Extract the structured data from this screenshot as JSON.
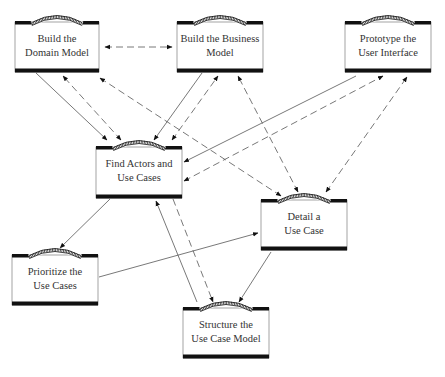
{
  "diagram": {
    "type": "activity-workflow",
    "colors": {
      "line": "#555555",
      "bar": "#111111",
      "box_fill": "#ffffff",
      "text": "#333333"
    },
    "activities": [
      {
        "id": "domain",
        "lines": [
          "Build the",
          "Domain Model"
        ],
        "x": 15,
        "y": 22,
        "w": 84,
        "h": 50
      },
      {
        "id": "business",
        "lines": [
          "Build the Business",
          "Model"
        ],
        "x": 177,
        "y": 22,
        "w": 86,
        "h": 50
      },
      {
        "id": "prototype",
        "lines": [
          "Prototype the",
          "User Interface"
        ],
        "x": 345,
        "y": 22,
        "w": 86,
        "h": 50
      },
      {
        "id": "find",
        "lines": [
          "Find Actors and",
          "Use Cases"
        ],
        "x": 96,
        "y": 147,
        "w": 86,
        "h": 51
      },
      {
        "id": "detail",
        "lines": [
          "Detail a",
          "Use Case"
        ],
        "x": 261,
        "y": 200,
        "w": 86,
        "h": 50
      },
      {
        "id": "prioritize",
        "lines": [
          "Prioritize the",
          "Use Cases"
        ],
        "x": 12,
        "y": 255,
        "w": 86,
        "h": 50
      },
      {
        "id": "structure",
        "lines": [
          "Structure the",
          "Use Case Model"
        ],
        "x": 183,
        "y": 308,
        "w": 86,
        "h": 50
      }
    ],
    "flows": [
      {
        "from": "domain",
        "to": "find",
        "style": "solid",
        "x1": 36,
        "y1": 73,
        "x2": 107,
        "y2": 140
      },
      {
        "from": "find",
        "to": "domain",
        "style": "dashed",
        "x1": 121,
        "y1": 140,
        "x2": 63,
        "y2": 76,
        "bidirectional": true
      },
      {
        "from": "detail",
        "to": "domain",
        "style": "dashed",
        "x1": 281,
        "y1": 196,
        "x2": 100,
        "y2": 78,
        "bidirectional": true
      },
      {
        "from": "domain",
        "to": "business",
        "style": "dashed",
        "x1": 105,
        "y1": 47,
        "x2": 172,
        "y2": 47,
        "bidirectional": true
      },
      {
        "from": "business",
        "to": "find",
        "style": "solid",
        "x1": 202,
        "y1": 73,
        "x2": 154,
        "y2": 140
      },
      {
        "from": "find",
        "to": "business",
        "style": "dashed",
        "x1": 172,
        "y1": 140,
        "x2": 218,
        "y2": 76,
        "bidirectional": true
      },
      {
        "from": "detail",
        "to": "business",
        "style": "dashed",
        "x1": 298,
        "y1": 192,
        "x2": 238,
        "y2": 76,
        "bidirectional": true
      },
      {
        "from": "prototype",
        "to": "find",
        "style": "solid",
        "x1": 356,
        "y1": 76,
        "x2": 184,
        "y2": 162
      },
      {
        "from": "find",
        "to": "prototype",
        "style": "dashed",
        "x1": 184,
        "y1": 181,
        "x2": 383,
        "y2": 76,
        "bidirectional": true
      },
      {
        "from": "detail",
        "to": "prototype",
        "style": "dashed",
        "x1": 326,
        "y1": 192,
        "x2": 407,
        "y2": 77,
        "bidirectional": true
      },
      {
        "from": "find",
        "to": "prioritize",
        "style": "solid",
        "x1": 110,
        "y1": 199,
        "x2": 60,
        "y2": 248
      },
      {
        "from": "prioritize",
        "to": "detail",
        "style": "solid",
        "x1": 99,
        "y1": 277,
        "x2": 258,
        "y2": 233
      },
      {
        "from": "structure",
        "to": "find",
        "style": "solid",
        "x1": 197,
        "y1": 302,
        "x2": 156,
        "y2": 201
      },
      {
        "from": "find",
        "to": "structure",
        "style": "dashed",
        "x1": 173,
        "y1": 199,
        "x2": 213,
        "y2": 302
      },
      {
        "from": "detail",
        "to": "structure",
        "style": "solid",
        "x1": 271,
        "y1": 252,
        "x2": 239,
        "y2": 302
      }
    ]
  }
}
